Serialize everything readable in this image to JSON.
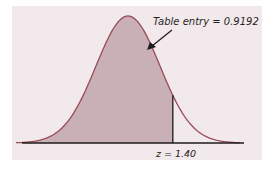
{
  "chart_data": {
    "type": "area",
    "title": "",
    "distribution": "standard normal",
    "shaded_region": {
      "from": "-inf",
      "to": 1.4
    },
    "annotations": [
      {
        "text": "Table entry = 0.9192",
        "points_to": "shaded area"
      },
      {
        "text": "z = 1.40",
        "position": "below axis at z = 1.40"
      }
    ],
    "z_value": 1.4,
    "table_entry": 0.9192,
    "xlim": [
      -3.5,
      3.5
    ],
    "grid": false,
    "colors": {
      "shade": "#c9b0b6",
      "curve": "#9a4a57",
      "axis": "#1e1a1b",
      "background": "#f1e9ec"
    }
  },
  "labels": {
    "table_entry": "Table entry = 0.9192",
    "z_label": "z = 1.40"
  }
}
